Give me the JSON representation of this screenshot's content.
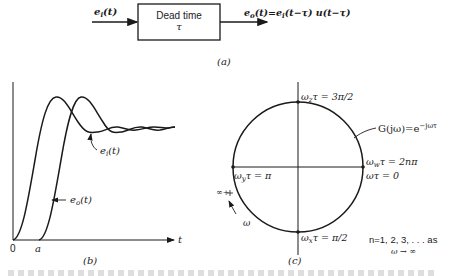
{
  "figure": {
    "panel_a": {
      "label": "(a)",
      "input_signal": "e",
      "input_sub": "i",
      "input_arg": "(t)",
      "block_title": "Dead time",
      "block_param": "τ",
      "output_signal": "e",
      "output_sub": "o",
      "output_expr": "(t)=e",
      "output_expr_sub": "i",
      "output_expr_rest": "(t−τ) u(t−τ)"
    },
    "panel_b": {
      "label": "(b)",
      "x_axis_label": "t",
      "origin_label": "0",
      "delay_label": "a",
      "curve_input_label": "e",
      "curve_input_sub": "i",
      "curve_input_arg": "(t)",
      "curve_output_label": "e",
      "curve_output_sub": "o",
      "curve_output_arg": "(t)"
    },
    "panel_c": {
      "label": "(c)",
      "top_point": {
        "w": "ω",
        "sub": "z",
        "rest": "τ = 3π/2"
      },
      "left_point": {
        "w": "ω",
        "sub": "y",
        "rest": "τ = π"
      },
      "bottom_point": {
        "w": "ω",
        "sub": "x",
        "rest": "τ = π/2"
      },
      "right_point_1": {
        "w": "ω",
        "sub": "w",
        "rest": "τ = 2nπ"
      },
      "right_point_2": "ωτ = 0",
      "transfer_fn": "G(jω)=e",
      "transfer_fn_exp": "−jωτ",
      "infinity_label": "∞+",
      "direction_label": "ω",
      "note_line1": "n=1, 2, 3, . . . as",
      "note_line2": "ω → ∞"
    }
  }
}
